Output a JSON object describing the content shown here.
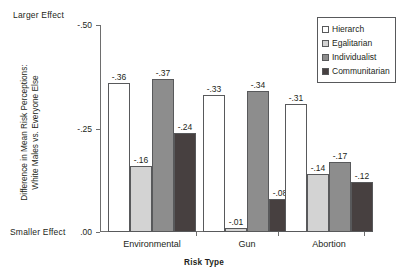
{
  "chart_data": {
    "type": "bar",
    "title": "",
    "xlabel": "Risk Type",
    "ylabel": "Difference in Mean Risk Perceptions:\nWhite Males vs. Everyone Else",
    "categories": [
      "Environmental",
      "Gun",
      "Abortion"
    ],
    "series": [
      {
        "name": "Hierarch",
        "values": [
          -0.36,
          -0.33,
          -0.31
        ],
        "labels": [
          "-.36",
          "-.33",
          "-.31"
        ],
        "color": "#ffffff"
      },
      {
        "name": "Egalitarian",
        "values": [
          -0.16,
          -0.01,
          -0.14
        ],
        "labels": [
          "-.16",
          "-.01",
          "-.14"
        ],
        "color": "#d3d3d3"
      },
      {
        "name": "Individualist",
        "values": [
          -0.37,
          -0.34,
          -0.17
        ],
        "labels": [
          "-.37",
          "-.34",
          "-.17"
        ],
        "color": "#8d8d8d"
      },
      {
        "name": "Communitarian",
        "values": [
          -0.24,
          -0.08,
          -0.12
        ],
        "labels": [
          "-.24",
          "-.08",
          "-.12"
        ],
        "color": "#474040"
      }
    ],
    "ylim": [
      0.0,
      -0.5
    ],
    "yticks": [
      -0.5,
      -0.25,
      0.0
    ],
    "ytick_labels": [
      "-.50",
      "-.25",
      ".00"
    ],
    "axis_notes": {
      "top": "Larger Effect",
      "bottom": "Smaller Effect"
    },
    "grid": false,
    "legend_position": "top-right",
    "legend_entries": [
      "Hierarch",
      "Egalitarian",
      "Individualist",
      "Communitarian"
    ]
  }
}
